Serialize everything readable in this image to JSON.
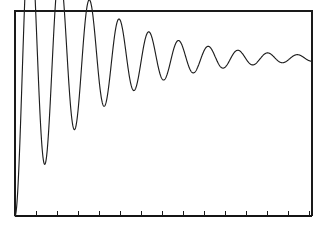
{
  "figure": {
    "background_color": "#ffffff",
    "frame_color": "#1a1a1a",
    "curve_color": "#1f1f1f",
    "width": 329,
    "height": 234
  },
  "axes": {
    "plot_left": 15,
    "plot_right": 312,
    "plot_top": 11,
    "plot_bottom": 216,
    "x_tick_count": 15,
    "x_tick_spacing": 21,
    "x_tick_length": 5,
    "x_tick_labels": [],
    "y_tick_labels": [],
    "title": "",
    "xlabel": "",
    "ylabel": ""
  },
  "chart_data": {
    "type": "line",
    "title": "",
    "subtitle": "",
    "xlabel": "",
    "ylabel": "",
    "grid": false,
    "legend": [],
    "legend_position": "none",
    "xlim": [
      0,
      14.14
    ],
    "ylim": [
      0,
      1.3
    ],
    "annotations": [],
    "model": {
      "form": "y(t) = K * (1 - exp(-zeta*wn*t)/sqrt(1-zeta^2) * sin(wd*t + phi))",
      "steady_state": 1.0,
      "first_peak_value": 1.22,
      "first_peak_time": 0.71,
      "damping_ratio": 0.063,
      "natural_frequency": 4.45,
      "damped_period": 1.415,
      "rise_start_time": 0.0
    },
    "series": [
      {
        "name": "step response",
        "x": [
          0.0,
          0.05,
          0.1,
          0.15,
          0.2,
          0.25,
          0.3,
          0.35,
          0.4,
          0.45,
          0.5,
          0.55,
          0.6,
          0.65,
          0.7,
          0.75,
          0.8,
          0.85,
          0.9,
          0.95,
          1.0,
          1.1,
          1.2,
          1.3,
          1.4,
          1.5,
          1.6,
          1.7,
          1.8,
          1.9,
          2.0,
          2.2,
          2.4,
          2.6,
          2.8,
          3.0,
          3.2,
          3.4,
          3.6,
          3.8,
          4.0,
          4.3,
          4.6,
          4.9,
          5.2,
          5.5,
          5.8,
          6.1,
          6.4,
          6.7,
          7.0,
          7.4,
          7.8,
          8.2,
          8.6,
          9.0,
          9.4,
          9.8,
          10.2,
          10.6,
          11.0,
          11.5,
          12.0,
          12.5,
          13.0,
          13.5,
          14.14
        ],
        "y": [
          0.0,
          0.03,
          0.11,
          0.23,
          0.38,
          0.54,
          0.7,
          0.85,
          0.97,
          1.07,
          1.14,
          1.19,
          1.21,
          1.22,
          1.215,
          1.19,
          1.15,
          1.1,
          1.04,
          0.97,
          0.91,
          0.84,
          0.81,
          0.82,
          0.86,
          0.92,
          0.99,
          1.06,
          1.11,
          1.145,
          1.15,
          1.11,
          1.02,
          0.93,
          0.87,
          0.855,
          0.89,
          0.95,
          1.02,
          1.08,
          1.11,
          1.09,
          1.01,
          0.93,
          0.89,
          0.9,
          0.96,
          1.03,
          1.08,
          1.09,
          1.05,
          0.96,
          0.91,
          0.92,
          0.98,
          1.05,
          1.07,
          1.03,
          0.96,
          0.92,
          0.94,
          1.02,
          1.06,
          1.02,
          0.95,
          0.95,
          1.02
        ]
      }
    ]
  }
}
